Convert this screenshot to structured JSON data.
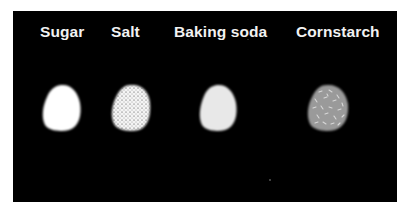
{
  "figure": {
    "background": "#000000",
    "samples": [
      {
        "label": "Sugar",
        "fill": "#ffffff",
        "texture": "none"
      },
      {
        "label": "Salt",
        "fill": "#f4f4f4",
        "texture": "dark-stipple"
      },
      {
        "label": "Baking soda",
        "fill": "#e8e8e8",
        "texture": "none"
      },
      {
        "label": "Cornstarch",
        "fill": "#9a9a9a",
        "texture": "light-dashes"
      }
    ]
  }
}
